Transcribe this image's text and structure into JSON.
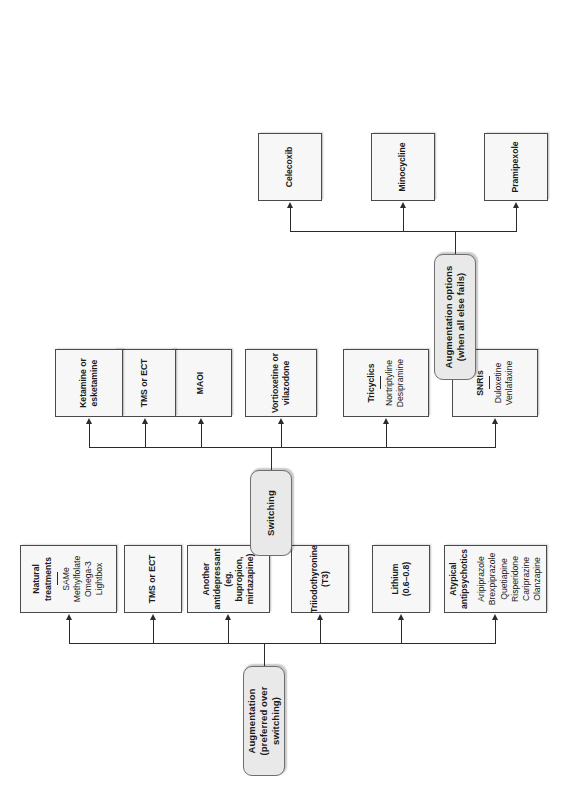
{
  "diagram": {
    "type": "flowchart",
    "orientation": "rotated-90-ccw",
    "colors": {
      "pill_fill": "#e9e9e9",
      "pill_border": "#6f6f6f",
      "box_fill": "#f7f7f7",
      "box_border": "#4a4a4a",
      "line": "#2b2b2b",
      "background": "#ffffff"
    },
    "branches": [
      {
        "id": "augmentation",
        "header_line1": "Augmentation",
        "header_line2": "(preferred over switching)",
        "nodes": [
          {
            "id": "atypical-antipsychotics",
            "title": "Atypical antipsychotics",
            "has_separator": true,
            "items": [
              "Aripiprazole",
              "Brexpiprazole",
              "Quetiapine",
              "Risperidone",
              "Cariprazine",
              "Olanzapine"
            ]
          },
          {
            "id": "lithium",
            "title": "Lithium",
            "has_separator": false,
            "items": [
              "(0.6–0.8)"
            ]
          },
          {
            "id": "triiodothyronine",
            "title": "Triiodothyronine",
            "has_separator": false,
            "items": [
              "(T3)"
            ]
          },
          {
            "id": "another-antidepressant",
            "title": "Another",
            "has_separator": false,
            "items": [
              "antidepressant",
              "(eg. bupropion,",
              "mirtazapine)"
            ]
          },
          {
            "id": "tms-or-ect-augmentation",
            "title": "TMS or ECT",
            "has_separator": false,
            "items": []
          },
          {
            "id": "natural-treatments",
            "title": "Natural treatments",
            "has_separator": true,
            "items": [
              "SAMe",
              "Methylfolate",
              "Omega-3",
              "Lightbox"
            ]
          }
        ]
      },
      {
        "id": "switching",
        "header_line1": "Switching",
        "header_line2": "",
        "nodes": [
          {
            "id": "snris",
            "title": "SNRIs",
            "has_separator": true,
            "items": [
              "Duloxetine",
              "Venlafaxine"
            ]
          },
          {
            "id": "tricyclics",
            "title": "Tricyclics",
            "has_separator": true,
            "items": [
              "Nortriptyline",
              "Desipramine"
            ]
          },
          {
            "id": "vortioxetine-vilazodone",
            "title": "Vortioxetine or",
            "has_separator": false,
            "items": [
              "vilazodone"
            ]
          },
          {
            "id": "maoi",
            "title": "MAOI",
            "has_separator": false,
            "items": []
          },
          {
            "id": "tms-or-ect-switching",
            "title": "TMS or ECT",
            "has_separator": false,
            "items": []
          },
          {
            "id": "ketamine-esketamine",
            "title": "Ketamine or",
            "has_separator": false,
            "items": [
              "esketamine"
            ]
          }
        ]
      },
      {
        "id": "augmentation-last-resort",
        "header_line1": "Augmentation options",
        "header_line2": "(when all else fails)",
        "nodes": [
          {
            "id": "pramipexole",
            "title": "Pramipexole",
            "has_separator": false,
            "items": []
          },
          {
            "id": "minocycline",
            "title": "Minocycline",
            "has_separator": false,
            "items": []
          },
          {
            "id": "celecoxib",
            "title": "Celecoxib",
            "has_separator": false,
            "items": []
          }
        ]
      }
    ]
  }
}
